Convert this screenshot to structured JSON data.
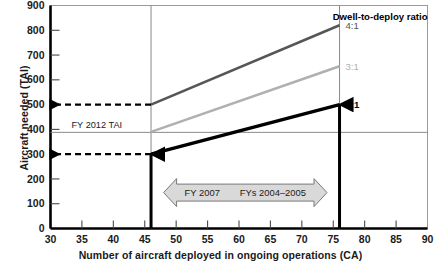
{
  "chart_data": {
    "type": "line",
    "title": "",
    "xlabel": "Number of aircraft deployed in ongoing operations (CA)",
    "ylabel": "Aircraft needed (TAI)",
    "xlim": [
      30,
      90
    ],
    "ylim": [
      0,
      900
    ],
    "xticks": [
      30,
      35,
      40,
      45,
      50,
      55,
      60,
      65,
      70,
      75,
      80,
      85,
      90
    ],
    "yticks": [
      0,
      100,
      200,
      300,
      400,
      500,
      600,
      700,
      800,
      900
    ],
    "grid": false,
    "legend_position": "right-of-line-ends",
    "legend_title": "Dwell-to-deploy ratio",
    "x": [
      46,
      76
    ],
    "series": [
      {
        "name": "4:1",
        "label": "4:1",
        "values": [
          500,
          820
        ],
        "color": "#565656",
        "width": 2.6
      },
      {
        "name": "3:1",
        "label": "3:1",
        "values": [
          390,
          655
        ],
        "color": "#b0b0b0",
        "width": 2.6
      },
      {
        "name": "2:1",
        "label": "2:1",
        "values": [
          300,
          500
        ],
        "color": "#000000",
        "width": 3.4
      }
    ],
    "reference_lines": [
      {
        "name": "fy-2012-tai",
        "label": "FY 2012 TAI",
        "orientation": "horizontal",
        "value": 388,
        "color": "#8a8a8a"
      },
      {
        "name": "ca-46-guide",
        "label": "",
        "orientation": "vertical",
        "value": 46,
        "color": "#8a8a8a"
      },
      {
        "name": "ca-76-guide",
        "label": "",
        "orientation": "vertical",
        "value": 76,
        "color": "#8a8a8a"
      }
    ],
    "callout_arrows": [
      {
        "name": "dashed-arrow-500",
        "from": [
          46,
          500
        ],
        "to": [
          30,
          500
        ],
        "style": "dashed",
        "color": "#000000"
      },
      {
        "name": "dashed-arrow-300",
        "from": [
          46,
          300
        ],
        "to": [
          30,
          300
        ],
        "style": "dashed",
        "color": "#000000"
      },
      {
        "name": "vertical-arrow-ca-46",
        "from": [
          46,
          0
        ],
        "to": [
          46,
          300
        ],
        "style": "solid",
        "color": "#000000"
      },
      {
        "name": "vertical-arrow-ca-76",
        "from": [
          76,
          0
        ],
        "to": [
          76,
          500
        ],
        "style": "solid",
        "color": "#000000"
      }
    ],
    "range_band": {
      "name": "fiscal-year-range-band",
      "x_start": 48,
      "x_end": 74,
      "y_center": 145,
      "left_label": "FY 2007",
      "right_label": "FYs 2004–2005",
      "fill": "#d9d9d9",
      "stroke": "#7a7a7a"
    }
  }
}
